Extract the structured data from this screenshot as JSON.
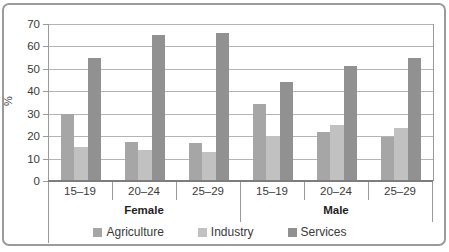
{
  "chart_data": {
    "type": "bar",
    "title": "",
    "xlabel": "",
    "ylabel": "%",
    "ylim": [
      0,
      70
    ],
    "yticks": [
      0,
      10,
      20,
      30,
      40,
      50,
      60,
      70
    ],
    "grid": true,
    "legend_position": "bottom",
    "group_labels": [
      "Female",
      "Male"
    ],
    "categories": [
      "15–19",
      "20–24",
      "25–29",
      "15–19",
      "20–24",
      "25–29"
    ],
    "series": [
      {
        "name": "Agriculture",
        "color": "#a6a6a6",
        "values": [
          30,
          17.5,
          17,
          34.5,
          22,
          19.5
        ]
      },
      {
        "name": "Industry",
        "color": "#c1c1c1",
        "values": [
          15,
          14,
          13,
          20,
          25,
          23.5
        ]
      },
      {
        "name": "Services",
        "color": "#919191",
        "values": [
          55,
          65,
          66,
          44,
          51.5,
          55
        ]
      }
    ]
  }
}
